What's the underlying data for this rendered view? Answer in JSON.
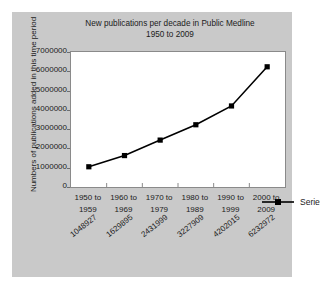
{
  "chart_data": {
    "type": "line",
    "title": "New publications per decade in Public Medline",
    "subtitle": "1950 to 2009",
    "xlabel": "",
    "ylabel": "Numbers of publications added in this time period",
    "categories": [
      "1950 to\n1959",
      "1960 to\n1969",
      "1970 to\n1979",
      "1980 to\n1989",
      "1990 to\n1999",
      "2000 to\n2009"
    ],
    "category_lines": [
      [
        "1950 to",
        "1959"
      ],
      [
        "1960 to",
        "1969"
      ],
      [
        "1970 to",
        "1979"
      ],
      [
        "1980 to",
        "1989"
      ],
      [
        "1990 to",
        "1999"
      ],
      [
        "2000 to",
        "2009"
      ]
    ],
    "values": [
      1048927,
      1629895,
      2431999,
      3227909,
      4202015,
      6232972
    ],
    "point_labels": [
      "1048927",
      "1629895",
      "2431999",
      "3227909",
      "4202015",
      "6232972"
    ],
    "series": [
      {
        "name": "Series 1",
        "values": [
          1048927,
          1629895,
          2431999,
          3227909,
          4202015,
          6232972
        ]
      }
    ],
    "ylim": [
      0,
      7000000
    ],
    "y_ticks": [
      0,
      1000000,
      2000000,
      3000000,
      4000000,
      5000000,
      6000000,
      7000000
    ],
    "y_tick_labels": [
      "7000000",
      "6000000",
      "5000000",
      "4000000",
      "3000000",
      "2000000",
      "1000000",
      "0"
    ],
    "grid": false,
    "legend_position": "inside-right",
    "colors": {
      "panel_background": "#c9c9c9",
      "plot_background": "#ffffff",
      "series_line": "#000000",
      "marker": "#000000",
      "axis": "#8a8a8a",
      "text": "#1b1b1b"
    }
  },
  "legend": {
    "entries": [
      {
        "label": "Series 1"
      }
    ]
  }
}
